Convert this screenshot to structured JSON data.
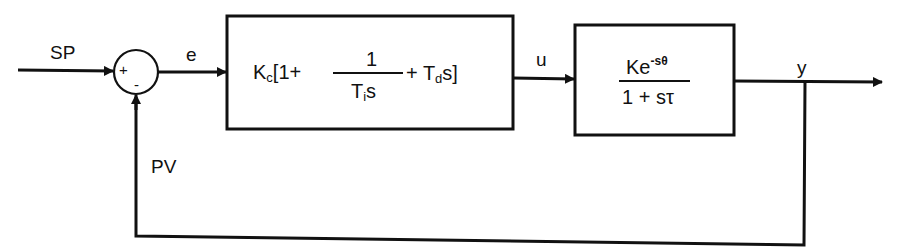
{
  "diagram": {
    "type": "closed-loop PID control block diagram",
    "signals": {
      "setpoint": "SP",
      "error": "e",
      "control": "u",
      "output": "y",
      "feedback": "PV"
    },
    "summing_junction": {
      "plus_sign": "+",
      "minus_sign": "-"
    },
    "controller_block": {
      "prefix": "K",
      "prefix_sub": "c",
      "bracket_open": "[1+",
      "frac_num": "1",
      "frac_den_T": "T",
      "frac_den_sub": "i",
      "frac_den_s": "s",
      "plus_derivative": "+ T",
      "derivative_sub": "d",
      "derivative_tail": "s]"
    },
    "plant_block": {
      "num_K": "Ke",
      "num_exp": "-sθ",
      "den": "1 + sτ"
    },
    "colors": {
      "line": "#111111",
      "background": "#ffffff"
    }
  }
}
